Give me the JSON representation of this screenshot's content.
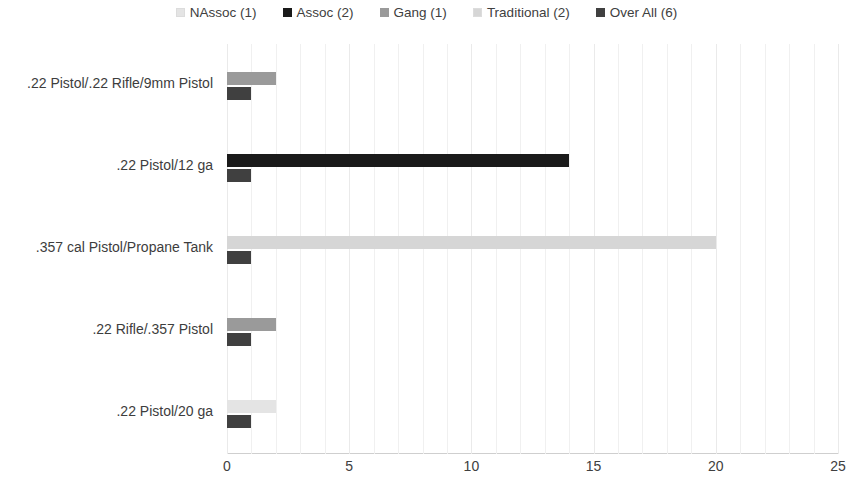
{
  "legend": {
    "position": "top-center",
    "items": [
      {
        "label": "NAssoc (1)",
        "color": "#e4e4e4"
      },
      {
        "label": "Assoc (2)",
        "color": "#1a1a1a"
      },
      {
        "label": "Gang (1)",
        "color": "#9a9a9a"
      },
      {
        "label": "Traditional (2)",
        "color": "#d6d6d6"
      },
      {
        "label": "Over All (6)",
        "color": "#404040"
      }
    ]
  },
  "axis": {
    "x_ticks": [
      "0",
      "5",
      "10",
      "15",
      "20",
      "25"
    ],
    "x_min": 0,
    "x_max": 25,
    "x_step": 5
  },
  "categories": [
    {
      "label": ".22 Pistol/.22 Rifle/9mm Pistol"
    },
    {
      "label": ".22 Pistol/12 ga"
    },
    {
      "label": ".357 cal Pistol/Propane Tank"
    },
    {
      "label": ".22 Rifle/.357 Pistol"
    },
    {
      "label": ".22 Pistol/20 ga"
    }
  ],
  "chart_data": {
    "type": "bar",
    "orientation": "horizontal",
    "title": "",
    "xlabel": "",
    "ylabel": "",
    "xlim": [
      0,
      25
    ],
    "grid": true,
    "legend_position": "top-center",
    "categories": [
      ".22 Pistol/.22 Rifle/9mm Pistol",
      ".22 Pistol/12 ga",
      ".357 cal Pistol/Propane Tank",
      ".22 Rifle/.357 Pistol",
      ".22 Pistol/20 ga"
    ],
    "series": [
      {
        "name": "NAssoc (1)",
        "color": "#e4e4e4",
        "values": [
          0,
          0,
          0,
          0,
          2
        ]
      },
      {
        "name": "Assoc (2)",
        "color": "#1a1a1a",
        "values": [
          0,
          14,
          0,
          0,
          0
        ]
      },
      {
        "name": "Gang (1)",
        "color": "#9a9a9a",
        "values": [
          2,
          0,
          0,
          2,
          0
        ]
      },
      {
        "name": "Traditional (2)",
        "color": "#d6d6d6",
        "values": [
          0,
          0,
          20,
          0,
          0
        ]
      },
      {
        "name": "Over All (6)",
        "color": "#404040",
        "values": [
          1,
          1,
          1,
          1,
          1
        ]
      }
    ]
  },
  "render": {
    "bars": [
      {
        "category_index": 0,
        "rows": [
          {
            "series": "Gang (1)",
            "value": 2,
            "color": "#9a9a9a"
          },
          {
            "series": "Over All (6)",
            "value": 1,
            "color": "#404040"
          }
        ]
      },
      {
        "category_index": 1,
        "rows": [
          {
            "series": "Assoc (2)",
            "value": 14,
            "color": "#1a1a1a"
          },
          {
            "series": "Over All (6)",
            "value": 1,
            "color": "#404040"
          }
        ]
      },
      {
        "category_index": 2,
        "rows": [
          {
            "series": "Traditional (2)",
            "value": 20,
            "color": "#d6d6d6"
          },
          {
            "series": "Over All (6)",
            "value": 1,
            "color": "#404040"
          }
        ]
      },
      {
        "category_index": 3,
        "rows": [
          {
            "series": "Gang (1)",
            "value": 2,
            "color": "#9a9a9a"
          },
          {
            "series": "Over All (6)",
            "value": 1,
            "color": "#404040"
          }
        ]
      },
      {
        "category_index": 4,
        "rows": [
          {
            "series": "NAssoc (1)",
            "value": 2,
            "color": "#e4e4e4"
          },
          {
            "series": "Over All (6)",
            "value": 1,
            "color": "#404040"
          }
        ]
      }
    ]
  }
}
